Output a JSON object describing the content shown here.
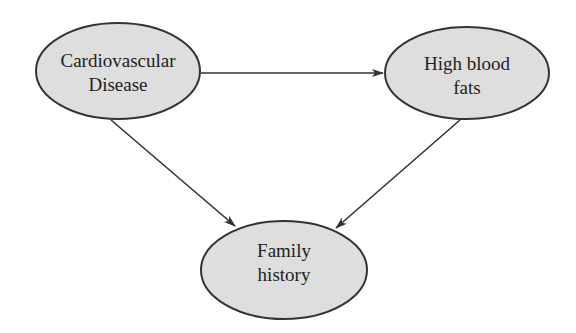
{
  "diagram": {
    "type": "directed-graph",
    "colors": {
      "node_fill": "#dedede",
      "node_stroke": "#333333",
      "edge": "#333333",
      "background": "#ffffff"
    },
    "nodes": [
      {
        "id": "cvd",
        "label_lines": [
          "Cardiovascular",
          "Disease"
        ],
        "line1": "Cardiovascular",
        "line2": "Disease"
      },
      {
        "id": "hbf",
        "label_lines": [
          "High blood",
          "fats"
        ],
        "line1": "High blood",
        "line2": "fats"
      },
      {
        "id": "fh",
        "label_lines": [
          "Family",
          "history"
        ],
        "line1": "Family",
        "line2": "history"
      }
    ],
    "edges": [
      {
        "from": "Cardiovascular Disease",
        "to": "High blood fats"
      },
      {
        "from": "Cardiovascular Disease",
        "to": "Family history"
      },
      {
        "from": "High blood fats",
        "to": "Family history"
      }
    ]
  }
}
